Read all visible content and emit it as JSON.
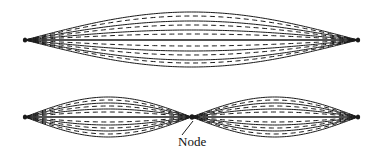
{
  "figure": {
    "width": 380,
    "height": 157,
    "background_color": "#ffffff",
    "stroke_color": "#1a1a1a"
  },
  "annotations": {
    "node_label": "Node",
    "node_label_x": 178,
    "node_label_y": 146,
    "leader_line": {
      "from_x": 182,
      "from_y": 135,
      "to_x": 193,
      "to_y": 121
    }
  },
  "chart_data": {
    "type": "line",
    "xlabel": "",
    "ylabel": "",
    "xlim": [
      25,
      358
    ],
    "ylim": [
      0,
      157
    ],
    "grid": false,
    "legend": "none",
    "panels": [
      {
        "name": "fundamental",
        "harmonic": 1,
        "nodes": 0,
        "antinodes": 1,
        "axis_y": 40,
        "left_endpoint_x": 25,
        "right_endpoint_x": 358,
        "max_amplitude": 28,
        "curves": [
          {
            "amplitude": 28,
            "dashed": false
          },
          {
            "amplitude": 19,
            "dashed": false
          },
          {
            "amplitude": 10,
            "dashed": false
          },
          {
            "amplitude": 0,
            "dashed": false
          },
          {
            "amplitude": -11,
            "dashed": false
          },
          {
            "amplitude": -20,
            "dashed": false
          },
          {
            "amplitude": -27,
            "dashed": false
          },
          {
            "amplitude": 24,
            "dashed": true
          },
          {
            "amplitude": 15,
            "dashed": true
          },
          {
            "amplitude": 6,
            "dashed": true
          },
          {
            "amplitude": -6,
            "dashed": true
          },
          {
            "amplitude": -15,
            "dashed": true
          },
          {
            "amplitude": -23,
            "dashed": true
          }
        ]
      },
      {
        "name": "second-harmonic",
        "harmonic": 2,
        "nodes": 1,
        "antinodes": 2,
        "axis_y": 117,
        "left_endpoint_x": 25,
        "right_endpoint_x": 358,
        "node_x": 192,
        "max_amplitude": 20,
        "curves": [
          {
            "amplitude": 20,
            "dashed": false
          },
          {
            "amplitude": 14,
            "dashed": false
          },
          {
            "amplitude": 8,
            "dashed": false
          },
          {
            "amplitude": 0,
            "dashed": false
          },
          {
            "amplitude": -8,
            "dashed": false
          },
          {
            "amplitude": -14,
            "dashed": false
          },
          {
            "amplitude": -20,
            "dashed": false
          },
          {
            "amplitude": 17,
            "dashed": true
          },
          {
            "amplitude": 11,
            "dashed": true
          },
          {
            "amplitude": 5,
            "dashed": true
          },
          {
            "amplitude": -5,
            "dashed": true
          },
          {
            "amplitude": -11,
            "dashed": true
          },
          {
            "amplitude": -17,
            "dashed": true
          }
        ]
      }
    ]
  }
}
